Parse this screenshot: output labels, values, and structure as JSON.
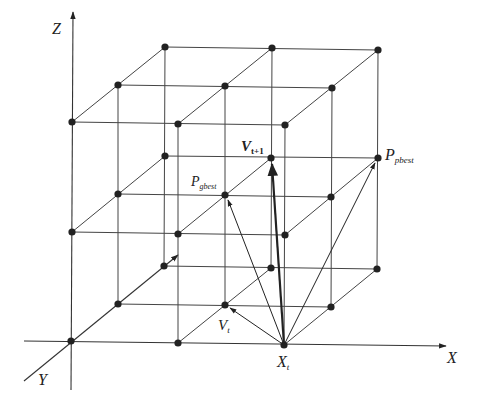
{
  "diagram": {
    "axes": {
      "x": {
        "label": "X"
      },
      "y": {
        "label": "Y"
      },
      "z": {
        "label": "Z"
      }
    },
    "labels": {
      "v_next_main": "V",
      "v_next_sub": "t+1",
      "p_pbest_main": "P",
      "p_pbest_sub": "pbest",
      "p_gbest_main": "P",
      "p_gbest_sub": "gbest",
      "v_t_main": "V",
      "v_t_sub": "t",
      "x_t_main": "X",
      "x_t_sub": "t"
    },
    "grid": {
      "planes": 3,
      "rows": 3,
      "columns": 3,
      "node_color": "#222222",
      "line_color": "#444444"
    },
    "vectors": [
      {
        "from": "X_t",
        "to": "V_t",
        "style": "thin"
      },
      {
        "from": "X_t",
        "to": "P_gbest",
        "style": "thin"
      },
      {
        "from": "X_t",
        "to": "V_t+1",
        "style": "thick"
      },
      {
        "from": "X_t",
        "to": "P_pbest",
        "style": "thin"
      }
    ]
  }
}
